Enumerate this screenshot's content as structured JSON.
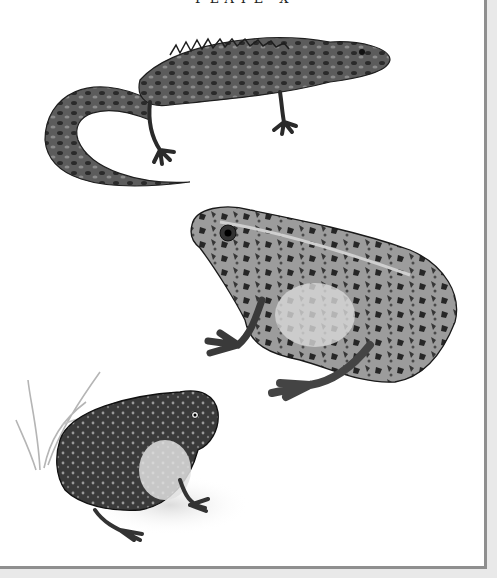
{
  "page": {
    "caption": "PLATE X",
    "background": "#ffffff",
    "margin_color": "#e9e9e9",
    "border_color": "#8f8f8f"
  },
  "illustration": {
    "subjects": [
      {
        "id": "newt",
        "label": "Crested newt",
        "position": "top"
      },
      {
        "id": "frog",
        "label": "Common frog",
        "position": "middle-right"
      },
      {
        "id": "toad",
        "label": "Toad with grass",
        "position": "bottom-left"
      }
    ],
    "style": "monochrome engraving"
  }
}
